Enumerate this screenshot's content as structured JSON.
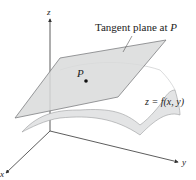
{
  "figure": {
    "callout_prefix": "Tangent plane at ",
    "callout_point": "P",
    "point_label": "P",
    "surface_label": "z = f(x, y)",
    "axes": {
      "x": "x",
      "y": "y",
      "z": "z"
    }
  },
  "colors": {
    "plane_fill": "#d9dadb",
    "plane_stroke": "#7d7f82",
    "surface_fill": "#e3e4e5",
    "surface_stroke": "#9a9c9e",
    "axis": "#333333"
  }
}
